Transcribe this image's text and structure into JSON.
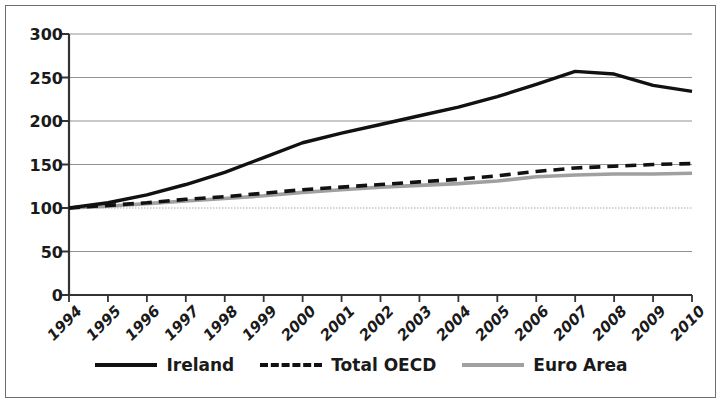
{
  "chart_data": {
    "type": "line",
    "title": "",
    "subtitle": "",
    "xlabel": "",
    "ylabel": "",
    "xlim": [
      1994,
      2010
    ],
    "ylim": [
      0,
      300
    ],
    "grid": true,
    "legend_position": "bottom",
    "x": [
      1994,
      1995,
      1996,
      1997,
      1998,
      1999,
      2000,
      2001,
      2002,
      2003,
      2004,
      2005,
      2006,
      2007,
      2008,
      2009,
      2010
    ],
    "categories": [
      "1994",
      "1995",
      "1996",
      "1997",
      "1998",
      "1999",
      "2000",
      "2001",
      "2002",
      "2003",
      "2004",
      "2005",
      "2006",
      "2007",
      "2008",
      "2009",
      "2010"
    ],
    "yticks": [
      0,
      50,
      100,
      150,
      200,
      250,
      300
    ],
    "ytick_labels": [
      "0",
      "50",
      "100",
      "150",
      "200",
      "250",
      "300"
    ],
    "series": [
      {
        "name": "Ireland",
        "style": "solid",
        "color": "#111111",
        "width": 3.4,
        "values": [
          100,
          106,
          115,
          127,
          141,
          158,
          175,
          186,
          196,
          206,
          216,
          228,
          242,
          257,
          254,
          241,
          234
        ]
      },
      {
        "name": "Total OECD",
        "style": "dashed",
        "color": "#111111",
        "width": 3.6,
        "values": [
          100,
          103,
          106,
          110,
          113,
          117,
          121,
          124,
          127,
          130,
          133,
          137,
          142,
          146,
          148,
          150,
          151
        ]
      },
      {
        "name": "Euro Area",
        "style": "solid",
        "color": "#a0a0a0",
        "width": 3.6,
        "values": [
          100,
          102,
          105,
          108,
          111,
          114,
          118,
          121,
          124,
          126,
          128,
          131,
          136,
          138,
          139,
          139,
          140
        ]
      }
    ]
  },
  "legend": {
    "items": [
      {
        "label": "Ireland",
        "swatch": "solid-black"
      },
      {
        "label": "Total OECD",
        "swatch": "dashed-black"
      },
      {
        "label": "Euro Area",
        "swatch": "solid-gray"
      }
    ]
  },
  "colors": {
    "ireland": "#111111",
    "total_oecd": "#111111",
    "euro_area": "#a0a0a0",
    "grid": "#8c8c8c",
    "axis": "#333333",
    "frame": "#6e6e6e",
    "background": "#ffffff"
  },
  "geometry": {
    "plot_left": 69,
    "plot_right": 692,
    "y_zero": 295,
    "y_top": 34
  }
}
